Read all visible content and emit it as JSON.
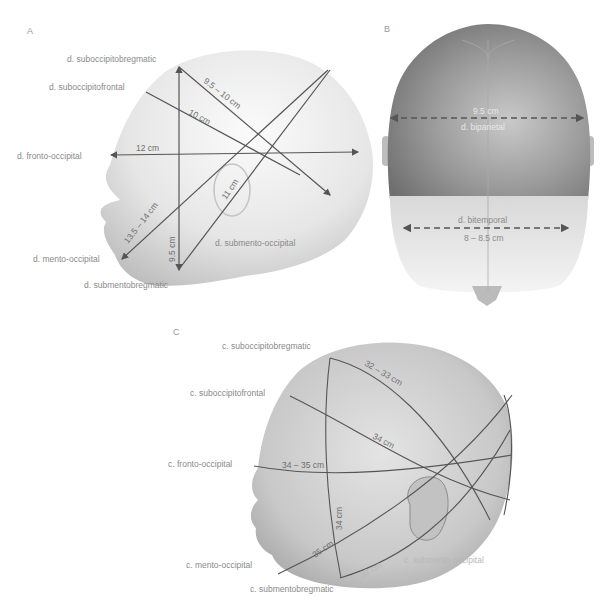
{
  "panels": {
    "A": {
      "letter": "A",
      "labels": {
        "suboccipitobregmatic": "d. suboccipitobregmatic",
        "suboccipitofrontal": "d. suboccipitofrontal",
        "fronto_occipital": "d. fronto-occipital",
        "mento_occipital": "d. mento-occipital",
        "submentobregmatic": "d. submentobregmatic",
        "submento_occipital": "d. submento-occipital"
      },
      "measurements": {
        "suboccipitobregmatic": "9.5 – 10 cm",
        "suboccipitofrontal": "10 cm",
        "fronto_occipital": "12 cm",
        "mento_occipital": "13.5 – 14 cm",
        "submentobregmatic": "9.5 cm",
        "submento_occipital": "11 cm"
      }
    },
    "B": {
      "letter": "B",
      "labels": {
        "biparietal": "d. biparietal",
        "bitemporal": "d. bitemporal"
      },
      "measurements": {
        "biparietal": "9.5 cm",
        "bitemporal": "8 – 8.5 cm"
      }
    },
    "C": {
      "letter": "C",
      "labels": {
        "suboccipitobregmatic": "c. suboccipitobregmatic",
        "suboccipitofrontal": "c. suboccipitofrontal",
        "fronto_occipital": "c. fronto-occipital",
        "mento_occipital": "c. mento-occipital",
        "submentobregmatic": "c. submentobregmatic",
        "submento_occipital": "c. submento-occipital"
      },
      "measurements": {
        "suboccipitobregmatic": "32 – 33 cm",
        "suboccipitofrontal": "34 cm",
        "fronto_occipital": "34 – 35 cm",
        "mento_occipital": "35 cm",
        "submentobregmatic": "34 cm",
        "submento_occipital": "32 cm"
      }
    }
  },
  "colors": {
    "line": "#555555",
    "label": "#8a8a8a",
    "head_light": "#f2f2f2",
    "head_mid": "#cfcfcf",
    "head_dark": "#7a7a7a"
  }
}
